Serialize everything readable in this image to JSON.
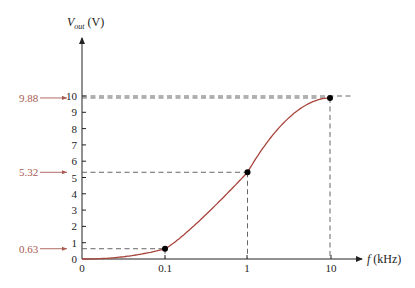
{
  "chart_data": {
    "type": "line",
    "title": "",
    "xlabel": "f (kHz)",
    "ylabel": "Vout (V)",
    "ylabel_main": "V",
    "ylabel_sub": "out",
    "ylabel_unit": " (V)",
    "xlabel_var": "f",
    "xlabel_unit": " (kHz)",
    "x_scale": "log",
    "x_ticks": [
      "0",
      "0.1",
      "1",
      "10"
    ],
    "y_ticks": [
      "0",
      "1",
      "2",
      "3",
      "4",
      "5",
      "6",
      "7",
      "8",
      "9",
      "10"
    ],
    "ylim": [
      0,
      10
    ],
    "grid": false,
    "series": [
      {
        "name": "Vout",
        "color": "#a8453c",
        "points": [
          {
            "x": 0.1,
            "y": 0.63
          },
          {
            "x": 1,
            "y": 5.32
          },
          {
            "x": 10,
            "y": 9.88
          }
        ]
      }
    ],
    "annotations": [
      {
        "label": "9.88",
        "y": 9.88,
        "color": "#a85a52"
      },
      {
        "label": "5.32",
        "y": 5.32,
        "color": "#a85a52"
      },
      {
        "label": "0.63",
        "y": 0.63,
        "color": "#a85a52"
      }
    ],
    "reference_line": {
      "y": 10
    }
  }
}
